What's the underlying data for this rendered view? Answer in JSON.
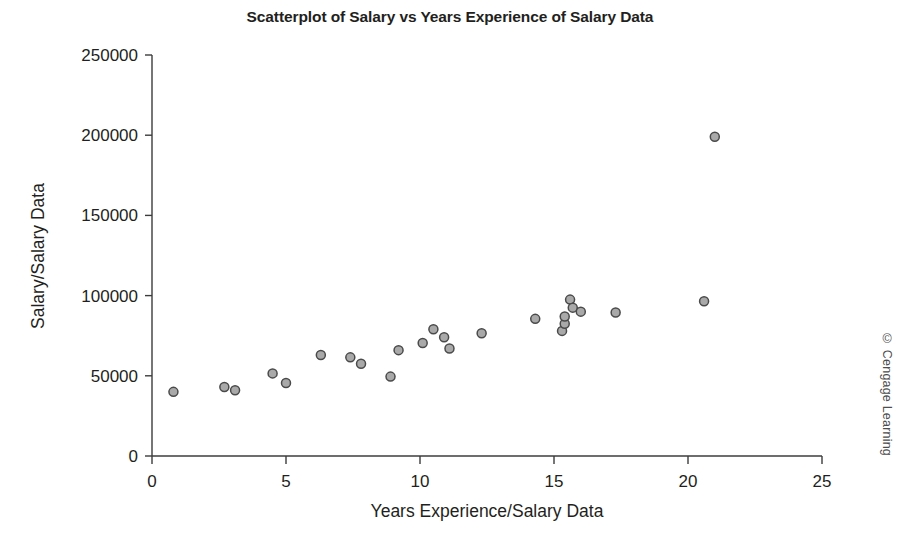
{
  "chart_data": {
    "type": "scatter",
    "title": "Scatterplot of Salary vs Years Experience of Salary Data",
    "xlabel": "Years Experience/Salary Data",
    "ylabel": "Salary/Salary Data",
    "xlim": [
      0,
      25
    ],
    "ylim": [
      0,
      250000
    ],
    "xticks": [
      0,
      5,
      10,
      15,
      20,
      25
    ],
    "xtick_labels": [
      "0",
      "5",
      "10",
      "15",
      "20",
      "25"
    ],
    "yticks": [
      0,
      50000,
      100000,
      150000,
      200000,
      250000
    ],
    "ytick_labels": [
      "0",
      "50000",
      "100000",
      "150000",
      "200000",
      "250000"
    ],
    "grid": false,
    "legend": null,
    "marker": {
      "shape": "circle",
      "fill_color": "#a9a9a9",
      "edge_color": "#4a4a4a",
      "size": 9
    },
    "series": [
      {
        "name": "Salary Data",
        "points": [
          {
            "x": 0.8,
            "y": 40000
          },
          {
            "x": 2.7,
            "y": 43000
          },
          {
            "x": 3.1,
            "y": 41000
          },
          {
            "x": 4.5,
            "y": 51500
          },
          {
            "x": 5.0,
            "y": 45500
          },
          {
            "x": 6.3,
            "y": 63000
          },
          {
            "x": 7.4,
            "y": 61500
          },
          {
            "x": 7.8,
            "y": 57500
          },
          {
            "x": 8.9,
            "y": 49500
          },
          {
            "x": 9.2,
            "y": 66000
          },
          {
            "x": 10.1,
            "y": 70500
          },
          {
            "x": 10.5,
            "y": 79000
          },
          {
            "x": 10.9,
            "y": 74000
          },
          {
            "x": 11.1,
            "y": 67000
          },
          {
            "x": 12.3,
            "y": 76500
          },
          {
            "x": 14.3,
            "y": 85500
          },
          {
            "x": 15.3,
            "y": 78000
          },
          {
            "x": 15.4,
            "y": 82500
          },
          {
            "x": 15.4,
            "y": 87000
          },
          {
            "x": 15.6,
            "y": 97500
          },
          {
            "x": 15.7,
            "y": 92500
          },
          {
            "x": 16.0,
            "y": 90000
          },
          {
            "x": 17.3,
            "y": 89500
          },
          {
            "x": 20.6,
            "y": 96500
          },
          {
            "x": 21.0,
            "y": 199000
          }
        ]
      }
    ]
  },
  "credit": "© Cengage Learning"
}
